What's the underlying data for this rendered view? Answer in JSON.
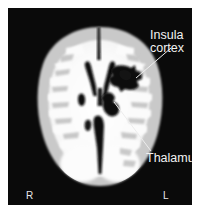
{
  "figure": {
    "modality": "axial-brain-mri",
    "background_color": "#ffffff",
    "scan_background_color": "#0a0a0a"
  },
  "annotations": {
    "insula": {
      "line1": "Insula",
      "line2": "cortex",
      "color": "#f2f2f2"
    },
    "thalamus": {
      "label": "Thalamus",
      "color": "#f2f2f2"
    }
  },
  "orientation": {
    "right_marker": "R",
    "left_marker": "L",
    "color": "#e8e8e8"
  },
  "tissue_colors": {
    "white_matter": "#fbfbfb",
    "grey_matter": "#c9c9c9",
    "cortex_edge": "#dedede",
    "csf_dark": "#101010",
    "lesion_dark": "#0d0d0d"
  }
}
